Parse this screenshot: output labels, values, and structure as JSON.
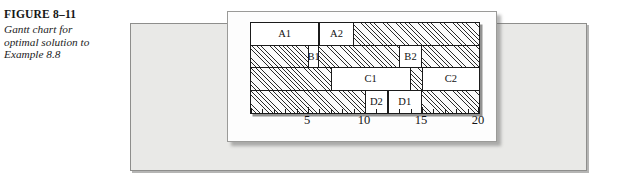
{
  "caption": {
    "figure_number": "FIGURE 8–11",
    "figure_number_lead": "F",
    "figure_number_rest": "IGURE",
    "figure_number_value": "8–11",
    "description": "Gantt chart for optimal solution to Example 8.8",
    "description_lines": [
      "Gantt chart for",
      "optimal solution to",
      "Example 8.8"
    ]
  },
  "chart_data": {
    "type": "bar",
    "subtype": "gantt",
    "title": "Gantt chart for optimal solution to Example 8.8",
    "xlabel": "",
    "ylabel": "",
    "xlim": [
      0,
      20
    ],
    "tick_interval": 1,
    "labeled_ticks": [
      5,
      10,
      15,
      20
    ],
    "tick_labels": [
      "5",
      "10",
      "15",
      "20"
    ],
    "grid": false,
    "legend": "none",
    "idle_fill": "diagonal-hatch",
    "busy_fill": "white",
    "rows": [
      {
        "row_index": 0,
        "machine": "A",
        "tasks": [
          {
            "label": "A1",
            "start": 0,
            "end": 6
          },
          {
            "label": "A2",
            "start": 6,
            "end": 9
          }
        ],
        "idle": [
          {
            "start": 9,
            "end": 20
          }
        ]
      },
      {
        "row_index": 1,
        "machine": "B",
        "tasks": [
          {
            "label": "B1",
            "start": 5,
            "end": 6
          },
          {
            "label": "B2",
            "start": 13,
            "end": 15
          }
        ],
        "idle": [
          {
            "start": 0,
            "end": 5
          },
          {
            "start": 6,
            "end": 13
          },
          {
            "start": 15,
            "end": 20
          }
        ]
      },
      {
        "row_index": 2,
        "machine": "C",
        "tasks": [
          {
            "label": "C1",
            "start": 7,
            "end": 14
          },
          {
            "label": "C2",
            "start": 15,
            "end": 20
          }
        ],
        "idle": [
          {
            "start": 0,
            "end": 7
          },
          {
            "start": 14,
            "end": 15
          }
        ]
      },
      {
        "row_index": 3,
        "machine": "D",
        "tasks": [
          {
            "label": "D2",
            "start": 10,
            "end": 12
          },
          {
            "label": "D1",
            "start": 12,
            "end": 15
          }
        ],
        "idle": [
          {
            "start": 0,
            "end": 10
          },
          {
            "start": 15,
            "end": 20
          }
        ]
      }
    ]
  },
  "colors": {
    "page_background": "#ffffff",
    "grey_panel": "#e9e9e7",
    "white_panel": "#fdfdfd",
    "chart_border": "#1b1b1b",
    "hatch": "#2a2a2a",
    "text": "#141414"
  }
}
